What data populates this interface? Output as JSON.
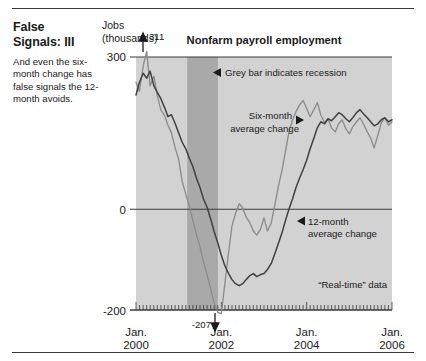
{
  "article": {
    "headline": "False Signals: III",
    "standfirst": "And even the six-month change has false signals the 12-month avoids."
  },
  "chart_data": {
    "type": "line",
    "title": "Nonfarm payroll employment",
    "ylabel_line1": "Jobs",
    "ylabel_line2": "(thousands)",
    "xlabel": "",
    "ylim": [
      -200,
      300
    ],
    "xlim": [
      2000.0,
      2006.0
    ],
    "ytick_labels": [
      "300",
      "0",
      "-200"
    ],
    "ytick_values": [
      300,
      0,
      -200
    ],
    "xtick_labels_line1": [
      "Jan.",
      "Jan.",
      "Jan.",
      "Jan."
    ],
    "xtick_labels_line2": [
      "2000",
      "2002",
      "2004",
      "2006"
    ],
    "xtick_values": [
      2000,
      2002,
      2004,
      2006
    ],
    "grid": false,
    "zero_line": true,
    "minor_ticks": "monthly",
    "annotations": [
      {
        "name": "peak-value",
        "text": "311",
        "x": 2000.25,
        "y": 311,
        "marker": "up-arrow"
      },
      {
        "name": "trough-value",
        "text": "-207",
        "x": 2001.6,
        "y": -207,
        "marker": "down-arrow"
      },
      {
        "name": "recession-note",
        "text": "Grey bar indicates recession",
        "marker": "left-arrow"
      },
      {
        "name": "six-month-label",
        "text": "Six-month average change",
        "marker": "right-arrow"
      },
      {
        "name": "twelve-month-label",
        "text": "12-month average change",
        "marker": "left-arrow"
      },
      {
        "name": "real-time-note",
        "text": "“Real-time” data",
        "marker": "none"
      }
    ],
    "shaded_regions": [
      {
        "name": "recession-band",
        "label": "recession",
        "x0": 2001.2,
        "x1": 2001.92,
        "color": "#a9a9a9"
      }
    ],
    "plot_background": "#d2d2d2",
    "series": [
      {
        "name": "Six-month average change",
        "color": "#8c8c8c",
        "x": [
          2000.0,
          2000.08,
          2000.17,
          2000.25,
          2000.33,
          2000.42,
          2000.5,
          2000.58,
          2000.67,
          2000.75,
          2000.83,
          2000.92,
          2001.0,
          2001.08,
          2001.17,
          2001.25,
          2001.33,
          2001.42,
          2001.5,
          2001.58,
          2001.67,
          2001.75,
          2001.83,
          2001.92,
          2002.0,
          2002.08,
          2002.17,
          2002.25,
          2002.33,
          2002.42,
          2002.5,
          2002.58,
          2002.67,
          2002.75,
          2002.83,
          2002.92,
          2003.0,
          2003.08,
          2003.17,
          2003.25,
          2003.33,
          2003.42,
          2003.5,
          2003.58,
          2003.67,
          2003.75,
          2003.83,
          2003.92,
          2004.0,
          2004.08,
          2004.17,
          2004.25,
          2004.33,
          2004.42,
          2004.5,
          2004.58,
          2004.67,
          2004.75,
          2004.83,
          2004.92,
          2005.0,
          2005.08,
          2005.17,
          2005.25,
          2005.33,
          2005.42,
          2005.5,
          2005.58,
          2005.67,
          2005.75,
          2005.83,
          2005.92,
          2006.0
        ],
        "y": [
          250,
          232,
          283,
          311,
          243,
          262,
          223,
          196,
          184,
          165,
          150,
          120,
          98,
          55,
          28,
          6,
          -22,
          -52,
          -75,
          -104,
          -132,
          -158,
          -186,
          -205,
          -207,
          -150,
          -86,
          -34,
          -10,
          10,
          2,
          -16,
          -28,
          -44,
          -52,
          -40,
          -18,
          -44,
          -28,
          6,
          42,
          75,
          112,
          150,
          176,
          192,
          205,
          214,
          198,
          182,
          196,
          210,
          186,
          170,
          178,
          160,
          152,
          168,
          176,
          158,
          148,
          162,
          172,
          180,
          168,
          152,
          140,
          120,
          146,
          170,
          180,
          165,
          172
        ]
      },
      {
        "name": "12-month average change",
        "color": "#404040",
        "x": [
          2000.0,
          2000.08,
          2000.17,
          2000.25,
          2000.33,
          2000.42,
          2000.5,
          2000.58,
          2000.67,
          2000.75,
          2000.83,
          2000.92,
          2001.0,
          2001.08,
          2001.17,
          2001.25,
          2001.33,
          2001.42,
          2001.5,
          2001.58,
          2001.67,
          2001.75,
          2001.83,
          2001.92,
          2002.0,
          2002.08,
          2002.17,
          2002.25,
          2002.33,
          2002.42,
          2002.5,
          2002.58,
          2002.67,
          2002.75,
          2002.83,
          2002.92,
          2003.0,
          2003.08,
          2003.17,
          2003.25,
          2003.33,
          2003.42,
          2003.5,
          2003.58,
          2003.67,
          2003.75,
          2003.83,
          2003.92,
          2004.0,
          2004.08,
          2004.17,
          2004.25,
          2004.33,
          2004.42,
          2004.5,
          2004.58,
          2004.67,
          2004.75,
          2004.83,
          2004.92,
          2005.0,
          2005.08,
          2005.17,
          2005.25,
          2005.33,
          2005.42,
          2005.5,
          2005.58,
          2005.67,
          2005.75,
          2005.83,
          2005.92,
          2006.0
        ],
        "y": [
          225,
          250,
          268,
          258,
          272,
          243,
          230,
          218,
          200,
          182,
          186,
          168,
          150,
          132,
          118,
          100,
          84,
          60,
          42,
          20,
          2,
          -20,
          -45,
          -68,
          -92,
          -112,
          -128,
          -140,
          -148,
          -152,
          -148,
          -140,
          -132,
          -128,
          -134,
          -130,
          -128,
          -120,
          -108,
          -90,
          -70,
          -48,
          -24,
          -2,
          20,
          42,
          60,
          78,
          96,
          118,
          140,
          160,
          172,
          168,
          178,
          174,
          182,
          190,
          186,
          178,
          172,
          180,
          190,
          196,
          188,
          180,
          172,
          164,
          168,
          176,
          180,
          172,
          176
        ]
      }
    ]
  }
}
